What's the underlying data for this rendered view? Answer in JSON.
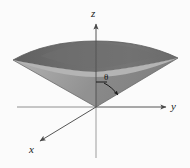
{
  "figure": {
    "name": "cone-surface-3d-coordinate-diagram",
    "background_color": "#fbfbfb",
    "axes": {
      "z": {
        "label": "z",
        "direction": "up"
      },
      "y": {
        "label": "y",
        "direction": "right"
      },
      "x": {
        "label": "x",
        "direction": "down-left"
      },
      "origin": {
        "x": 96,
        "y": 107
      },
      "line_color": "#555555"
    },
    "annotations": {
      "angle": {
        "label": "θ",
        "description": "angle measured from z-axis down toward cone surface",
        "arc_color": "#1a1a1a"
      }
    },
    "surface": {
      "name": "cone",
      "apex": {
        "x": 96,
        "y": 107
      },
      "opening": "upward",
      "top_ellipse_color": "#6b6b6b",
      "body_left_color": "#9a9a9a",
      "body_right_color": "#8a8a8a",
      "body_front_color": "#a8a8a8",
      "outline_color": "#5a5a5a",
      "left_tip": {
        "x": 13,
        "y": 60
      },
      "right_tip": {
        "x": 178,
        "y": 58
      },
      "rim_top": {
        "x": 96,
        "y": 44
      },
      "rim_bottom": {
        "x": 96,
        "y": 76
      }
    }
  }
}
